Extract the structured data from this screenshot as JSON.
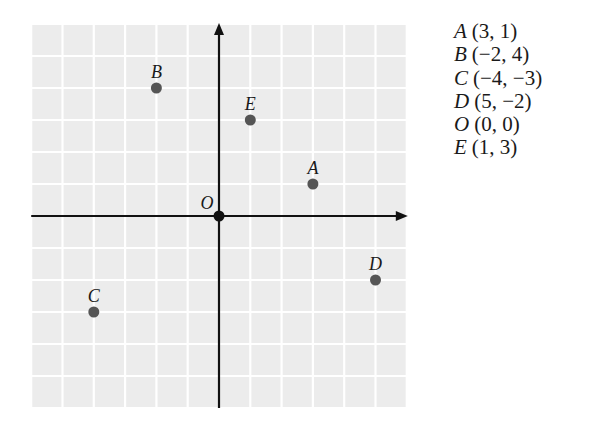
{
  "chart_data": {
    "type": "scatter",
    "title": "",
    "xlabel": "",
    "ylabel": "",
    "xlim": [
      -6,
      6
    ],
    "ylim": [
      -6,
      6
    ],
    "grid": true,
    "axes_arrows": [
      "x+",
      "y+"
    ],
    "origin_label": "O",
    "points": [
      {
        "label": "A",
        "x": 3,
        "y": 1
      },
      {
        "label": "B",
        "x": -2,
        "y": 4
      },
      {
        "label": "C",
        "x": -4,
        "y": -3
      },
      {
        "label": "D",
        "x": 5,
        "y": -2
      },
      {
        "label": "O",
        "x": 0,
        "y": 0
      },
      {
        "label": "E",
        "x": 1,
        "y": 3
      }
    ],
    "legend_position": "right"
  },
  "legend": {
    "rows": [
      {
        "label": "A",
        "coords": "(3, 1)"
      },
      {
        "label": "B",
        "coords": "(−2, 4)"
      },
      {
        "label": "C",
        "coords": "(−4, −3)"
      },
      {
        "label": "D",
        "coords": "(5, −2)"
      },
      {
        "label": "O",
        "coords": "(0, 0)"
      },
      {
        "label": "E",
        "coords": "(1, 3)"
      }
    ]
  },
  "colors": {
    "grid_cell": "#ececec",
    "grid_line": "#ffffff",
    "axis": "#111111",
    "point": "#555555",
    "origin_point": "#111111",
    "text": "#1a1a1a"
  }
}
